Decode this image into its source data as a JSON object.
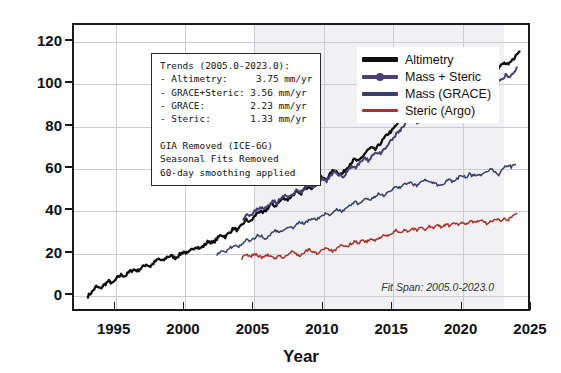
{
  "chart_data": {
    "type": "line",
    "title": "",
    "xlabel": "Year",
    "ylabel": "Sea Level Rise (mm)",
    "xlim": [
      1992.0,
      2025.0
    ],
    "ylim": [
      -8,
      128
    ],
    "xticks": [
      1995,
      2000,
      2005,
      2010,
      2015,
      2020,
      2025
    ],
    "yticks": [
      0,
      20,
      40,
      60,
      80,
      100,
      120
    ],
    "grid": true,
    "legend_position": "top-center-right",
    "shaded_span": {
      "label": "Fit Span",
      "start": 2005.0,
      "end": 2023.0
    },
    "annotations": [
      "Trends (2005.0-2023.0):",
      "- Altimetry:      3.75 mm/yr",
      "- GRACE+Steric: 3.56 mm/yr",
      "- GRACE:          2.23 mm/yr",
      "- Steric:            1.33 mm/yr",
      "GIA Removed (ICE-6G)",
      "Seasonal Fits Removed",
      "60-day smoothing applied"
    ],
    "series": [
      {
        "name": "Altimetry",
        "color": "#0d0d0d",
        "marker": false,
        "x": [
          1993.0,
          1993.3,
          1993.6,
          1993.9,
          1994.2,
          1994.5,
          1994.8,
          1995.1,
          1995.4,
          1995.7,
          1996.0,
          1996.3,
          1996.6,
          1996.9,
          1997.2,
          1997.5,
          1997.8,
          1998.1,
          1998.4,
          1998.7,
          1999.0,
          1999.3,
          1999.6,
          1999.9,
          2000.2,
          2000.5,
          2000.8,
          2001.1,
          2001.4,
          2001.7,
          2002.0,
          2002.3,
          2002.6,
          2002.9,
          2003.2,
          2003.5,
          2003.8,
          2004.1,
          2004.4,
          2004.7,
          2005.0,
          2005.3,
          2005.6,
          2005.9,
          2006.2,
          2006.5,
          2006.8,
          2007.1,
          2007.4,
          2007.7,
          2008.0,
          2008.3,
          2008.6,
          2008.9,
          2009.2,
          2009.5,
          2009.8,
          2010.1,
          2010.4,
          2010.7,
          2011.0,
          2011.3,
          2011.6,
          2011.9,
          2012.2,
          2012.5,
          2012.8,
          2013.1,
          2013.4,
          2013.7,
          2014.0,
          2014.3,
          2014.6,
          2014.9,
          2015.2,
          2015.5,
          2015.8,
          2016.1,
          2016.4,
          2016.7,
          2017.0,
          2017.3,
          2017.6,
          2017.9,
          2018.2,
          2018.5,
          2018.8,
          2019.1,
          2019.4,
          2019.7,
          2020.0,
          2020.3,
          2020.6,
          2020.9,
          2021.2,
          2021.5,
          2021.8,
          2022.1,
          2022.4,
          2022.7,
          2023.0,
          2023.3,
          2023.6,
          2023.9,
          2024.1
        ],
        "y": [
          0.0,
          2.0,
          4.5,
          3.5,
          5.5,
          7.0,
          6.0,
          8.5,
          10.0,
          9.5,
          11.5,
          12.5,
          12.0,
          13.5,
          15.0,
          14.0,
          16.0,
          17.5,
          16.5,
          18.5,
          19.0,
          18.0,
          19.5,
          21.0,
          20.0,
          22.0,
          23.5,
          22.5,
          24.0,
          26.0,
          25.0,
          27.0,
          29.0,
          28.0,
          30.0,
          32.0,
          31.0,
          33.5,
          36.0,
          35.0,
          37.5,
          40.0,
          39.0,
          41.0,
          43.5,
          42.5,
          44.5,
          46.5,
          45.5,
          47.5,
          49.0,
          48.0,
          50.5,
          52.0,
          51.0,
          53.5,
          56.0,
          55.0,
          57.0,
          59.5,
          58.5,
          57.5,
          60.0,
          62.5,
          64.5,
          63.5,
          66.0,
          68.5,
          70.0,
          69.0,
          71.5,
          74.0,
          76.5,
          78.0,
          80.5,
          83.0,
          85.0,
          87.5,
          86.0,
          87.0,
          88.5,
          87.5,
          89.5,
          91.5,
          93.0,
          92.0,
          94.5,
          96.5,
          98.5,
          97.5,
          99.5,
          101.5,
          100.5,
          102.5,
          104.0,
          103.0,
          105.0,
          107.0,
          106.0,
          108.5,
          110.0,
          109.0,
          111.5,
          114.0,
          115.5
        ]
      },
      {
        "name": "Mass + Steric",
        "color": "#4b3f72",
        "marker": true,
        "x": [
          2004.2,
          2004.5,
          2004.8,
          2005.1,
          2005.4,
          2005.7,
          2006.0,
          2006.3,
          2006.6,
          2006.9,
          2007.2,
          2007.5,
          2007.8,
          2008.1,
          2008.4,
          2008.7,
          2009.0,
          2009.3,
          2009.6,
          2009.9,
          2010.2,
          2010.5,
          2010.8,
          2011.1,
          2011.4,
          2011.7,
          2012.0,
          2012.3,
          2012.6,
          2012.9,
          2013.2,
          2013.5,
          2013.8,
          2014.1,
          2014.4,
          2014.7,
          2015.0,
          2015.3,
          2015.6,
          2015.9,
          2016.2,
          2016.5,
          2016.8,
          2017.1,
          2017.4,
          2017.7,
          2018.0,
          2018.3,
          2018.6,
          2018.9,
          2019.2,
          2019.5,
          2019.8,
          2020.1,
          2020.4,
          2020.7,
          2021.0,
          2021.3,
          2021.6,
          2021.9,
          2022.2,
          2022.5,
          2022.8,
          2023.1,
          2023.4,
          2023.7,
          2023.9
        ],
        "y": [
          37.0,
          39.0,
          38.0,
          40.5,
          42.0,
          41.0,
          43.0,
          45.0,
          44.0,
          46.0,
          47.5,
          46.5,
          48.5,
          50.0,
          49.0,
          51.0,
          52.5,
          51.5,
          53.5,
          55.5,
          54.5,
          56.5,
          58.5,
          57.5,
          56.0,
          59.0,
          61.5,
          60.5,
          63.0,
          65.0,
          64.0,
          66.5,
          68.0,
          67.0,
          69.5,
          72.0,
          74.5,
          77.0,
          79.0,
          81.5,
          84.0,
          83.0,
          81.5,
          84.5,
          86.0,
          85.0,
          87.5,
          89.0,
          88.0,
          90.5,
          92.5,
          91.5,
          93.5,
          95.5,
          94.5,
          96.5,
          98.5,
          97.5,
          96.0,
          99.0,
          101.0,
          100.0,
          102.5,
          104.5,
          103.0,
          106.0,
          108.0
        ]
      },
      {
        "name": "Mass (GRACE)",
        "color": "#3b3f6b",
        "marker": false,
        "x": [
          2002.3,
          2002.6,
          2002.9,
          2003.2,
          2003.5,
          2003.8,
          2004.1,
          2004.4,
          2004.7,
          2005.0,
          2005.3,
          2005.6,
          2005.9,
          2006.2,
          2006.5,
          2006.8,
          2007.1,
          2007.4,
          2007.7,
          2008.0,
          2008.3,
          2008.6,
          2008.9,
          2009.2,
          2009.5,
          2009.8,
          2010.1,
          2010.4,
          2010.7,
          2011.0,
          2011.3,
          2011.6,
          2011.9,
          2012.2,
          2012.5,
          2012.8,
          2013.1,
          2013.4,
          2013.7,
          2014.0,
          2014.3,
          2014.6,
          2014.9,
          2015.2,
          2015.5,
          2015.8,
          2016.1,
          2016.4,
          2016.7,
          2017.0,
          2017.3,
          2017.6,
          2018.4,
          2018.7,
          2019.0,
          2019.3,
          2019.6,
          2019.9,
          2020.2,
          2020.5,
          2020.8,
          2021.1,
          2021.4,
          2021.7,
          2022.0,
          2022.3,
          2022.6,
          2022.9,
          2023.2,
          2023.5,
          2023.8
        ],
        "y": [
          20.0,
          21.5,
          20.5,
          22.5,
          24.0,
          23.0,
          25.0,
          26.5,
          25.5,
          27.5,
          29.0,
          28.0,
          27.0,
          29.5,
          31.0,
          30.0,
          31.5,
          33.0,
          32.0,
          33.5,
          35.0,
          34.0,
          35.5,
          37.0,
          36.0,
          37.5,
          39.0,
          38.0,
          39.5,
          41.0,
          40.0,
          41.5,
          43.0,
          44.5,
          43.5,
          45.0,
          46.5,
          45.5,
          47.0,
          48.5,
          47.5,
          49.0,
          50.5,
          52.0,
          51.0,
          52.5,
          54.0,
          53.0,
          52.0,
          54.5,
          55.5,
          54.0,
          52.0,
          53.5,
          55.0,
          54.0,
          55.5,
          57.0,
          56.0,
          57.5,
          56.5,
          58.0,
          57.0,
          58.5,
          60.0,
          59.0,
          57.5,
          60.5,
          62.0,
          61.0,
          62.0
        ]
      },
      {
        "name": "Steric (Argo)",
        "color": "#a8332a",
        "marker": false,
        "x": [
          2004.1,
          2004.4,
          2004.7,
          2005.0,
          2005.3,
          2005.6,
          2005.9,
          2006.2,
          2006.5,
          2006.8,
          2007.1,
          2007.4,
          2007.7,
          2008.0,
          2008.3,
          2008.6,
          2008.9,
          2009.2,
          2009.5,
          2009.8,
          2010.1,
          2010.4,
          2010.7,
          2011.0,
          2011.3,
          2011.6,
          2011.9,
          2012.2,
          2012.5,
          2012.8,
          2013.1,
          2013.4,
          2013.7,
          2014.0,
          2014.3,
          2014.6,
          2014.9,
          2015.2,
          2015.5,
          2015.8,
          2016.1,
          2016.4,
          2016.7,
          2017.0,
          2017.3,
          2017.6,
          2017.9,
          2018.2,
          2018.5,
          2018.8,
          2019.1,
          2019.4,
          2019.7,
          2020.0,
          2020.3,
          2020.6,
          2020.9,
          2021.2,
          2021.5,
          2021.8,
          2022.1,
          2022.4,
          2022.7,
          2023.0,
          2023.3,
          2023.6,
          2023.9
        ],
        "y": [
          18.0,
          19.5,
          18.5,
          20.0,
          19.0,
          18.0,
          19.5,
          18.5,
          17.5,
          19.0,
          18.0,
          19.5,
          21.0,
          20.0,
          19.0,
          20.5,
          22.0,
          21.0,
          20.0,
          21.5,
          23.0,
          22.0,
          21.0,
          22.5,
          24.0,
          23.0,
          24.5,
          26.0,
          25.0,
          26.5,
          25.5,
          27.0,
          26.0,
          27.5,
          29.0,
          28.0,
          29.5,
          31.0,
          30.0,
          31.5,
          30.5,
          32.0,
          31.0,
          32.5,
          31.5,
          33.0,
          32.0,
          33.5,
          32.5,
          34.0,
          33.0,
          34.5,
          33.5,
          35.0,
          34.0,
          35.5,
          34.5,
          36.0,
          35.0,
          34.0,
          35.5,
          36.5,
          35.5,
          37.0,
          36.0,
          38.0,
          39.0
        ]
      }
    ]
  },
  "legend": {
    "items": [
      {
        "label": "Altimetry"
      },
      {
        "label": "Mass + Steric"
      },
      {
        "label": "Mass (GRACE)"
      },
      {
        "label": "Steric (Argo)"
      }
    ]
  },
  "trend_box": {
    "text": "Trends (2005.0-2023.0):\n- Altimetry:     3.75 mm/yr\n- GRACE+Steric: 3.56 mm/yr\n- GRACE:        2.23 mm/yr\n- Steric:       1.33 mm/yr\n\nGIA Removed (ICE-6G)\nSeasonal Fits Removed\n60-day smoothing applied"
  },
  "fit_note": "Fit Span: 2005.0-2023.0",
  "axis_titles": {
    "x": "Year",
    "y": "Sea Level Rise (mm)"
  }
}
